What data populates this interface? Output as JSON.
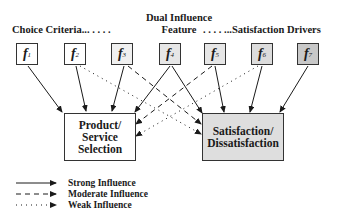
{
  "headers": {
    "choice_criteria": "Choice Criteria... . . .  .",
    "dual_line1": "Dual Influence",
    "dual_line2": "Feature",
    "satisfaction_drivers": ". . . . ...Satisfaction Drivers"
  },
  "features": [
    {
      "id": "f1",
      "letter": "f",
      "sub": "1",
      "fill": "#ffffff"
    },
    {
      "id": "f2",
      "letter": "f",
      "sub": "2",
      "fill": "#ffffff"
    },
    {
      "id": "f3",
      "letter": "f",
      "sub": "3",
      "fill": "#f0f0f0"
    },
    {
      "id": "f4",
      "letter": "f",
      "sub": "4",
      "fill": "#e6e6e6"
    },
    {
      "id": "f5",
      "letter": "f",
      "sub": "5",
      "fill": "#e6e6e6"
    },
    {
      "id": "f6",
      "letter": "f",
      "sub": "6",
      "fill": "#dcdcdc"
    },
    {
      "id": "f7",
      "letter": "f",
      "sub": "7",
      "fill": "#c8c8c8"
    }
  ],
  "targets": {
    "product_selection": {
      "line1": "Product/",
      "line2": "Service",
      "line3": "Selection",
      "fill": "#ffffff"
    },
    "satisfaction": {
      "line1": "Satisfaction/",
      "line2": "Dissatisfaction",
      "fill": "#dedede"
    }
  },
  "connections": [
    {
      "from": "f1",
      "to": "product_selection",
      "type": "strong"
    },
    {
      "from": "f2",
      "to": "product_selection",
      "type": "strong"
    },
    {
      "from": "f2",
      "to": "satisfaction",
      "type": "weak"
    },
    {
      "from": "f3",
      "to": "product_selection",
      "type": "strong"
    },
    {
      "from": "f3",
      "to": "satisfaction",
      "type": "moderate"
    },
    {
      "from": "f4",
      "to": "product_selection",
      "type": "strong"
    },
    {
      "from": "f4",
      "to": "satisfaction",
      "type": "strong"
    },
    {
      "from": "f5",
      "to": "product_selection",
      "type": "moderate"
    },
    {
      "from": "f5",
      "to": "satisfaction",
      "type": "strong"
    },
    {
      "from": "f6",
      "to": "product_selection",
      "type": "weak"
    },
    {
      "from": "f6",
      "to": "satisfaction",
      "type": "strong"
    },
    {
      "from": "f7",
      "to": "satisfaction",
      "type": "strong"
    }
  ],
  "legend": [
    {
      "type": "strong",
      "label": "Strong Influence"
    },
    {
      "type": "moderate",
      "label": "Moderate Influence"
    },
    {
      "type": "weak",
      "label": "Weak Influence"
    }
  ]
}
